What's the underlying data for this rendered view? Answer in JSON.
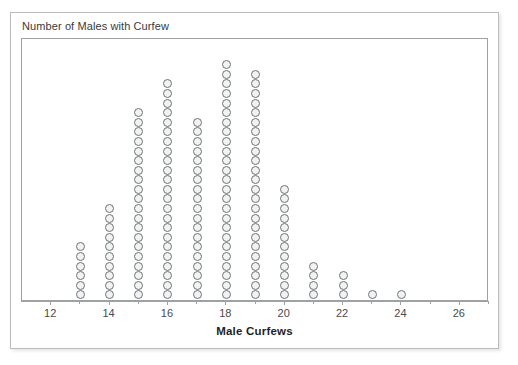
{
  "chart": {
    "title": "Number of Males with Curfew",
    "x_axis_label": "Male Curfews"
  },
  "chart_data": {
    "type": "bar",
    "plot_style": "dot-plot",
    "title": "Number of Males with Curfew",
    "xlabel": "Male Curfews",
    "ylabel": "",
    "grid": false,
    "legend": false,
    "xlim": [
      11,
      27
    ],
    "x_major_ticks": [
      12,
      14,
      16,
      18,
      20,
      22,
      24,
      26
    ],
    "x_minor_ticks": [
      13,
      15,
      17,
      19,
      21,
      23,
      25,
      27
    ],
    "x_tick_labels": [
      "12",
      "14",
      "16",
      "18",
      "20",
      "22",
      "24",
      "26"
    ],
    "categories": [
      13,
      14,
      15,
      16,
      17,
      18,
      19,
      20,
      21,
      22,
      23,
      24
    ],
    "values": [
      6,
      10,
      20,
      23,
      19,
      25,
      24,
      12,
      4,
      3,
      1,
      1
    ]
  },
  "colors": {
    "dot_fill": "#f2f2f0",
    "dot_stroke": "#6e7478",
    "frame": "#9fa2a5",
    "card_border": "#b9bcbe",
    "text": "#3a3a3a"
  }
}
